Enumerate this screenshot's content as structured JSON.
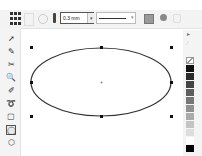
{
  "property_bar": {
    "outline_width": "0.3 mm",
    "outline_width_dropdown_icon": "chevron-down-icon",
    "line_style_dropdown_icon": "chevron-down-icon",
    "icons": [
      "object-origin-grid-icon",
      "object-origin-alt-icon",
      "circle-icon",
      "outline-pen-icon",
      "outline-width-input",
      "line-style-dropdown",
      "to-curve-icon",
      "settings-icon",
      "lock-icon"
    ]
  },
  "toolbox": {
    "tools": [
      {
        "name": "pick-tool",
        "glyph": "➚"
      },
      {
        "name": "shape-tool",
        "glyph": "✎"
      },
      {
        "name": "crop-tool",
        "glyph": "✂"
      },
      {
        "name": "zoom-tool",
        "glyph": "🔍"
      },
      {
        "name": "freehand-tool",
        "glyph": "✐"
      },
      {
        "name": "smart-fill-tool",
        "glyph": "➰"
      },
      {
        "name": "rectangle-tool",
        "glyph": "▢"
      },
      {
        "name": "ellipse-tool",
        "glyph": "◯",
        "selected": true
      },
      {
        "name": "polygon-tool",
        "glyph": "⬡"
      }
    ]
  },
  "canvas": {
    "selected_object": "ellipse",
    "outline_color": "#333333"
  },
  "palette": {
    "colors": [
      "none",
      "#111111",
      "#2a2a2a",
      "#444444",
      "#5e5e5e",
      "#777777",
      "#919191",
      "#aaaaaa",
      "#c4c4c4",
      "#dddddd",
      "#ffffff",
      "#000000"
    ]
  }
}
